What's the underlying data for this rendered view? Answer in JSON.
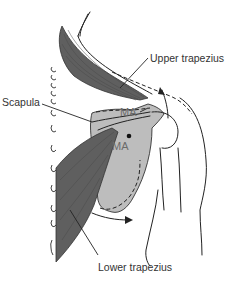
{
  "diagram": {
    "labels": {
      "upper_trapezius": "Upper trapezius",
      "scapula": "Scapula",
      "lower_trapezius": "Lower trapezius",
      "ma_upper": "MA",
      "ma_lower": "MA"
    },
    "colors": {
      "muscle": "#5f5f5f",
      "scapula": "#bdbdbd",
      "line": "#222222",
      "label": "#333333",
      "ma_label": "#6b6b6b"
    },
    "vertebrae_count": 13
  }
}
